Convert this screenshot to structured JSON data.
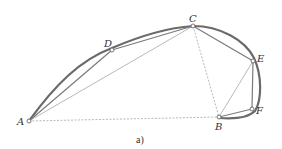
{
  "figure": {
    "caption": "a)",
    "colors": {
      "arc": "#666666",
      "chord": "#8a8a8a",
      "dashed": "#999999",
      "point_fill": "#ffffff",
      "point_stroke": "#555555"
    },
    "points": [
      {
        "id": "A",
        "label": "A",
        "x": 29,
        "y": 121
      },
      {
        "id": "D",
        "label": "D",
        "x": 112,
        "y": 50
      },
      {
        "id": "C",
        "label": "C",
        "x": 193,
        "y": 26
      },
      {
        "id": "E",
        "label": "E",
        "x": 253,
        "y": 61
      },
      {
        "id": "F",
        "label": "F",
        "x": 252,
        "y": 109
      },
      {
        "id": "B",
        "label": "B",
        "x": 219,
        "y": 117
      }
    ],
    "solid_chords": [
      [
        "A",
        "D"
      ],
      [
        "D",
        "C"
      ],
      [
        "C",
        "E"
      ],
      [
        "E",
        "F"
      ],
      [
        "F",
        "B"
      ],
      [
        "A",
        "C"
      ]
    ],
    "thin_chords": [
      [
        "A",
        "C"
      ],
      [
        "E",
        "B"
      ]
    ],
    "dashed_segments": [
      [
        "A",
        "B"
      ],
      [
        "C",
        "B"
      ]
    ],
    "curve": "A-D-C-E-F-B"
  }
}
